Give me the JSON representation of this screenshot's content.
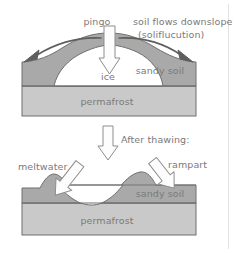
{
  "figure": {
    "colors": {
      "background": "#ffffff",
      "sandy_soil_fill": "#a9a9a9",
      "permafrost_fill": "#c9c9c9",
      "ice_fill": "#ffffff",
      "meltwater_fill": "#ffffff",
      "outline": "#6f6f6f",
      "text": "#7a7a7a",
      "arrow_fill": "#fdfdfd",
      "arrow_stroke": "#8a8a8a",
      "divider": "#dcdcdc"
    }
  },
  "top_panel": {
    "name": "pingo-stage",
    "labels": {
      "pingo": "pingo",
      "solifluction_line1": "soil flows downslope",
      "solifluction_line2": "(soliflucution)",
      "ice": "ice",
      "sandy_soil": "sandy soil",
      "permafrost": "permafrost"
    },
    "arrows": {
      "down_arrow": "block-arrow-down",
      "left_flow_arrow": "curved-arrow-left",
      "right_flow_arrow": "curved-arrow-right"
    }
  },
  "transition": {
    "name": "after-thawing-transition",
    "label": "After thawing:",
    "arrow": "block-arrow-down"
  },
  "bottom_panel": {
    "name": "collapsed-pingo-stage",
    "labels": {
      "meltwater": "meltwater",
      "rampart": "rampart",
      "sandy_soil": "sandy soil",
      "permafrost": "permafrost"
    },
    "arrows": {
      "meltwater_arrow": "block-arrow-down-right",
      "rampart_arrow": "block-arrow-down-left"
    }
  }
}
